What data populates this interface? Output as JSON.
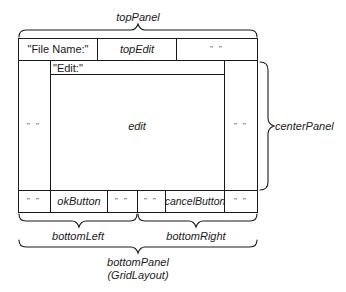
{
  "diagram": {
    "type": "layout-diagram",
    "top_panel": {
      "label": "topPanel",
      "cells": [
        "\"File Name:\"",
        "topEdit",
        "\" \""
      ]
    },
    "center_panel": {
      "label": "centerPanel",
      "edit_label": "\"Edit:\"",
      "edit": "edit",
      "left_filler": "\" \"",
      "right_filler": "\" \""
    },
    "bottom_panel": {
      "label": "bottomPanel",
      "sublabel": "(GridLayout)",
      "left": {
        "label": "bottomLeft",
        "cells": [
          "\" \"",
          "okButton",
          "\" \""
        ]
      },
      "right": {
        "label": "bottomRight",
        "cells": [
          "\" \"",
          "cancelButton",
          "\" \""
        ]
      }
    },
    "colors": {
      "line": "#1a1a1a",
      "background": "#ffffff"
    }
  }
}
